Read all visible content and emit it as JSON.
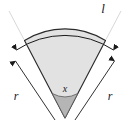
{
  "figure": {
    "name": "circular-sector-diagram",
    "background_color": "#ffffff",
    "sector": {
      "fill_color": "#e2e2e2",
      "stroke_color": "#2b2b2b",
      "apex_wedge_fill": "#b5b5b5"
    },
    "annotations": {
      "arc_label": "l",
      "radius_left_label": "r",
      "radius_right_label": "r",
      "angle_label": "x"
    },
    "arrow_color": "#1a1a1a",
    "guide_line_color": "#6e6e6e"
  }
}
